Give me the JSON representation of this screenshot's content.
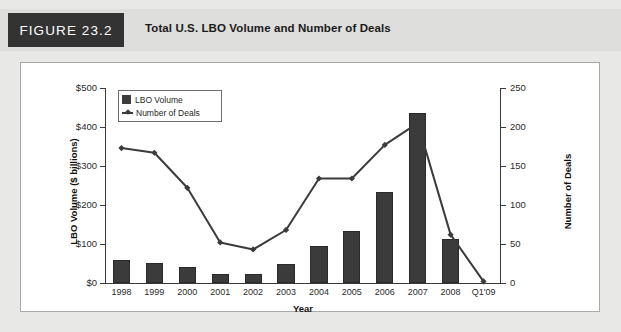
{
  "figure": {
    "tag": "FIGURE 23.2",
    "title": "Total U.S. LBO Volume and Number of Deals"
  },
  "colors": {
    "bar": "#3b3b3b",
    "line": "#3b3b3b",
    "axis": "#3a3a3a",
    "tag_background": "#333333",
    "panel_background": "#ffffff",
    "page_background": "#e8e8e6"
  },
  "chart_data": {
    "type": "bar",
    "title": "Total U.S. LBO Volume and Number of Deals",
    "xlabel": "Year",
    "ylabel": "LBO Volume ($ billions)",
    "y2label": "Number of Deals",
    "categories": [
      "1998",
      "1999",
      "2000",
      "2001",
      "2002",
      "2003",
      "2004",
      "2005",
      "2006",
      "2007",
      "2008",
      "Q1'09"
    ],
    "ylim": [
      0,
      500
    ],
    "y2lim": [
      0,
      250
    ],
    "yticks": [
      0,
      100,
      200,
      300,
      400,
      500
    ],
    "ytick_labels": [
      "$0",
      "$100",
      "$200",
      "$300",
      "$400",
      "$500"
    ],
    "y2ticks": [
      0,
      50,
      100,
      150,
      200,
      250
    ],
    "y2tick_labels": [
      "0",
      "50",
      "100",
      "150",
      "200",
      "250"
    ],
    "grid": false,
    "legend_position": "upper-left-inside",
    "series": [
      {
        "name": "LBO Volume",
        "type": "bar",
        "axis": "left",
        "unit": "$ billions",
        "values": [
          58,
          52,
          42,
          24,
          24,
          50,
          95,
          133,
          233,
          435,
          112,
          0
        ]
      },
      {
        "name": "Number of Deals",
        "type": "line",
        "axis": "right",
        "unit": "deals",
        "values": [
          173,
          167,
          122,
          52,
          43,
          68,
          134,
          134,
          177,
          205,
          62,
          2
        ]
      }
    ]
  }
}
